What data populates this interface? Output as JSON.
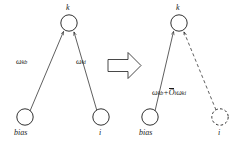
{
  "figure": {
    "type": "diagram",
    "background_color": "#ffffff",
    "stroke_color": "#1a1a1a"
  },
  "left_graph": {
    "top_node": {
      "label": "k",
      "style": "solid"
    },
    "bottom_left_node": {
      "label": "bias",
      "style": "solid"
    },
    "bottom_right_node": {
      "label": "i",
      "style": "solid"
    },
    "edge_left": {
      "weight_symbol": "ω",
      "weight_sub": "kb",
      "style": "solid",
      "arrowhead": true
    },
    "edge_right": {
      "weight_symbol": "ω",
      "weight_sub": "ki",
      "style": "solid",
      "arrowhead": true
    }
  },
  "transition": {
    "icon": "right-block-arrow",
    "glyph": "⇒"
  },
  "right_graph": {
    "top_node": {
      "label": "k",
      "style": "solid"
    },
    "bottom_left_node": {
      "label": "bias",
      "style": "solid"
    },
    "bottom_right_node": {
      "label": "i",
      "style": "dashed"
    },
    "edge_left": {
      "formula_part1": "ω",
      "formula_sub1": "kb",
      "formula_plus": "+",
      "formula_overline": "O",
      "formula_sub2": "i",
      "formula_part2": "ω",
      "formula_sub3": "ki",
      "style": "solid",
      "arrowhead": true
    },
    "edge_right": {
      "style": "dashed",
      "arrowhead": true
    }
  }
}
